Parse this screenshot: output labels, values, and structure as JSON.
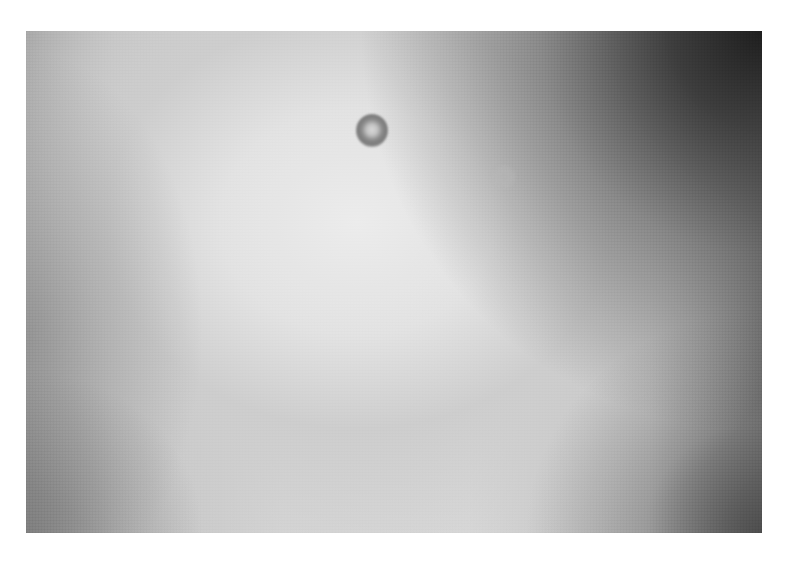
{
  "image": {
    "type": "brightfield micrograph",
    "description": "Grayscale microscope field with uneven illumination and a single ring-shaped particle/cell",
    "colors": {
      "center_brightness": "#ececec",
      "midfield": "#d0d0d0",
      "dark_corner_top_right": "#1e1e1e",
      "particle_ring": "#7a7a7a",
      "page_background": "#ffffff"
    },
    "objects": [
      {
        "name": "ring-particle",
        "center_x": 372,
        "center_y": 130,
        "diameter_px": 32
      },
      {
        "name": "faint-particle",
        "center_x": 504,
        "center_y": 177,
        "diameter_px": 24
      }
    ]
  }
}
